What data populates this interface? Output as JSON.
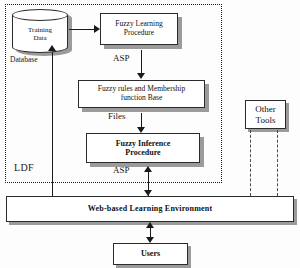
{
  "diagram": {
    "container": {
      "name": "LDF",
      "label": "LDF",
      "border_style": "dotted"
    },
    "nodes": {
      "training_data": {
        "label_line1": "Training",
        "label_line2": "Data",
        "shape": "cylinder",
        "caption": "Database"
      },
      "fuzzy_learning": {
        "label_line1": "Fuzzy Learning",
        "label_line2": "Procedure"
      },
      "fuzzy_rules": {
        "label_line1": "Fuzzy rules and Membership",
        "label_line2": "function Base"
      },
      "fuzzy_inference": {
        "label_line1": "Fuzzy Inference",
        "label_line2": "Procedure"
      },
      "other_tools": {
        "label_line1": "Other",
        "label_line2": "Tools"
      },
      "web_environment": {
        "label": "Web-based Learning Environment"
      },
      "users": {
        "label": "Users"
      }
    },
    "edge_labels": {
      "asp_top": "ASP",
      "files": "Files",
      "asp_bottom": "ASP"
    },
    "colors": {
      "stroke": "#1a1a1a",
      "shadow": "#9b9b9b",
      "fill": "#ffffff",
      "background": "#fdfdfd"
    }
  }
}
